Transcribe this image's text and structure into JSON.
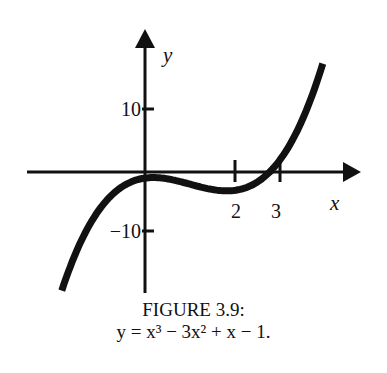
{
  "chart_data": {
    "type": "line",
    "title": "FIGURE 3.9:",
    "subtitle": "y = x³ − 3x² + x − 1.",
    "function": "x^3 - 3x^2 + x - 1",
    "xlabel": "x",
    "ylabel": "y",
    "x_ticks": [
      {
        "value": 2,
        "label": "2"
      },
      {
        "value": 3,
        "label": "3"
      }
    ],
    "y_ticks": [
      {
        "value": 10,
        "label": "10"
      },
      {
        "value": -10,
        "label": "−10"
      }
    ],
    "xlim": [
      -2.6,
      4.6
    ],
    "ylim": [
      -21,
      22
    ],
    "grid": false,
    "legend": null,
    "x": [
      -1.85,
      -1.5,
      -1.0,
      -0.5,
      0.0,
      0.5,
      1.0,
      1.5,
      2.0,
      2.5,
      3.0,
      3.5,
      3.95
    ],
    "y": [
      -19.26,
      -13.63,
      -6.0,
      -2.38,
      -1.0,
      -1.13,
      -2.0,
      -2.63,
      -3.0,
      -2.63,
      2.0,
      3.63,
      17.5
    ]
  },
  "figure": {
    "caption_label": "FIGURE 3.9:",
    "equation": "y = x³ − 3x² + x − 1."
  }
}
